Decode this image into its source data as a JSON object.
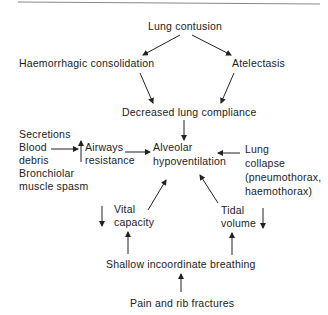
{
  "nodes": {
    "lung_contusion": "Lung contusion",
    "haemorrhagic_consolidation": "Haemorrhagic consolidation",
    "atelectasis": "Atelectasis",
    "decreased_compliance": "Decreased lung compliance",
    "alveolar_1": "Alveolar",
    "alveolar_2": "hypoventilation",
    "causes": [
      "Secretions",
      "Blood",
      "debris",
      "Bronchiolar",
      "muscle spasm"
    ],
    "airways_1": "Airways",
    "airways_2": "resistance",
    "collapse": [
      "Lung",
      "collapse",
      "(pneumothorax,",
      "haemothorax)"
    ],
    "vital_1": "Vital",
    "vital_2": "capacity",
    "tidal_1": "Tidal",
    "tidal_2": "volume",
    "shallow": "Shallow incoordinate breathing",
    "pain": "Pain and rib fractures"
  },
  "colors": {
    "ink": "#222222",
    "rule": "#888888"
  }
}
